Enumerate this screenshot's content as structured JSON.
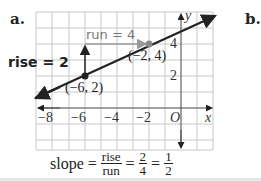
{
  "panel_labels": {
    "a": "a.",
    "b": "b."
  },
  "graph": {
    "axis_labels": {
      "x": "x",
      "y": "y",
      "origin": "O"
    },
    "x_ticks": [
      "−8",
      "−6",
      "−4",
      "−2"
    ],
    "y_ticks": [
      "4",
      "2"
    ],
    "points": [
      {
        "label": "(−6, 2)",
        "x": -6,
        "y": 2,
        "color": "#222222"
      },
      {
        "label": "(−2, 4)",
        "x": -2,
        "y": 4,
        "color": "#888888"
      }
    ],
    "annotations": {
      "rise": "rise = 2",
      "run": "run = 4"
    },
    "colors": {
      "line": "#222222",
      "grid": "#c8c8c8",
      "run_arrow": "#999999",
      "rise_arrow": "#222222"
    }
  },
  "formula": {
    "prefix": "slope =",
    "frac1_num": "rise",
    "frac1_den": "run",
    "eq1": "=",
    "frac2_num": "2",
    "frac2_den": "4",
    "eq2": "=",
    "frac3_num": "1",
    "frac3_den": "2"
  }
}
